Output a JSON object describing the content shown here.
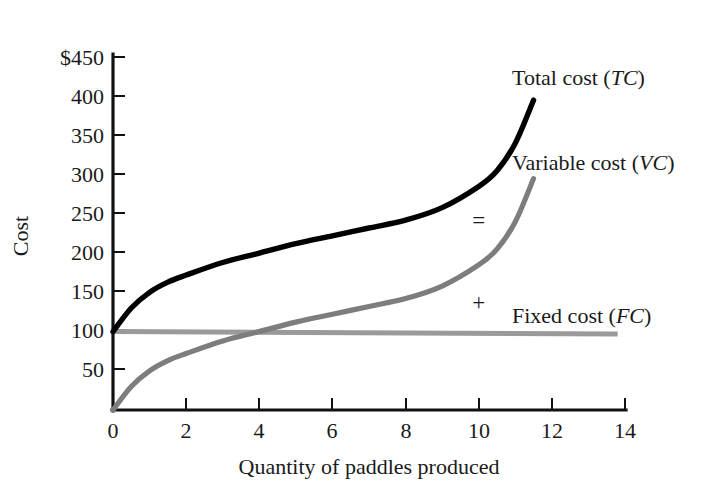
{
  "chart_data": {
    "type": "line",
    "title": "",
    "xlabel": "Quantity of paddles produced",
    "ylabel": "Cost",
    "xlim": [
      0,
      14
    ],
    "ylim": [
      0,
      450
    ],
    "grid": false,
    "legend_position": "inline-right",
    "x_ticks": [
      "0",
      "2",
      "4",
      "6",
      "8",
      "10",
      "12",
      "14"
    ],
    "x_tick_values": [
      0,
      2,
      4,
      6,
      8,
      10,
      12,
      14
    ],
    "y_ticks": [
      "50",
      "100",
      "150",
      "200",
      "250",
      "300",
      "350",
      "400",
      "$450"
    ],
    "y_tick_values": [
      50,
      100,
      150,
      200,
      250,
      300,
      350,
      400,
      450
    ],
    "y_axis_currency_prefix": "$",
    "series": [
      {
        "name": "Total cost",
        "abbr": "TC",
        "label_text": "Total cost (",
        "label_close": ")",
        "color": "#000000",
        "x": [
          0,
          0.5,
          1,
          1.5,
          2,
          3,
          4,
          5,
          6,
          7,
          8,
          9,
          10,
          10.5,
          11,
          11.5
        ],
        "values": [
          100,
          130,
          150,
          163,
          172,
          188,
          200,
          212,
          222,
          232,
          242,
          258,
          285,
          305,
          340,
          395
        ]
      },
      {
        "name": "Variable cost",
        "abbr": "VC",
        "label_text": "Variable cost (",
        "label_close": ")",
        "color": "#7d7d7d",
        "x": [
          0,
          0.5,
          1,
          1.5,
          2,
          3,
          4,
          5,
          6,
          7,
          8,
          9,
          10,
          10.5,
          11,
          11.5
        ],
        "values": [
          0,
          30,
          50,
          63,
          72,
          88,
          100,
          112,
          122,
          132,
          142,
          158,
          185,
          205,
          240,
          295
        ]
      },
      {
        "name": "Fixed cost",
        "abbr": "FC",
        "label_text": "Fixed cost (",
        "label_close": ")",
        "color": "#9a9a9a",
        "x": [
          0,
          13.8
        ],
        "values": [
          100,
          97
        ]
      }
    ],
    "annotations": [
      {
        "name": "equals-sign",
        "text": "=",
        "x": 10.0,
        "y": 232
      },
      {
        "name": "plus-sign",
        "text": "+",
        "x": 10.0,
        "y": 127
      }
    ]
  },
  "labels": {
    "total_cost_prefix": "Total cost (",
    "total_cost_abbr": "TC",
    "total_cost_suffix": ")",
    "variable_cost_prefix": "Variable cost (",
    "variable_cost_abbr": "VC",
    "variable_cost_suffix": ")",
    "fixed_cost_prefix": "Fixed cost (",
    "fixed_cost_abbr": "FC",
    "fixed_cost_suffix": ")",
    "equals": "=",
    "plus": "+"
  }
}
